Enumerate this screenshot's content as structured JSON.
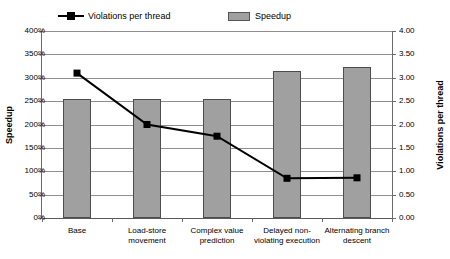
{
  "legend": {
    "entries": [
      {
        "label": "Violations per thread",
        "type": "line-marker",
        "color": "#000000"
      },
      {
        "label": "Speedup",
        "type": "bar-swatch",
        "color": "#a0a0a0"
      }
    ]
  },
  "axes": {
    "left_title": "Speedup",
    "right_title": "Violations per thread",
    "left_ticks": [
      "0%",
      "50%",
      "100%",
      "150%",
      "200%",
      "250%",
      "300%",
      "350%",
      "400%"
    ],
    "right_ticks": [
      "0.00",
      "0.50",
      "1.00",
      "1.50",
      "2.00",
      "2.50",
      "3.00",
      "3.50",
      "4.00"
    ]
  },
  "chart_data": {
    "type": "bar",
    "title": "",
    "xlabel": "",
    "ylabel": "Speedup",
    "y2label": "Violations per thread",
    "categories": [
      "Base",
      "Load-store movement",
      "Complex value prediction",
      "Delayed non-violating execution",
      "Alternating branch descent"
    ],
    "series": [
      {
        "name": "Speedup",
        "type": "bar",
        "axis": "left",
        "unit": "%",
        "color": "#a0a0a0",
        "values": [
          255,
          255,
          255,
          315,
          322
        ]
      },
      {
        "name": "Violations per thread",
        "type": "line",
        "axis": "right",
        "color": "#000000",
        "marker": "square",
        "values": [
          3.1,
          2.0,
          1.75,
          0.85,
          0.86
        ]
      }
    ],
    "ylim": [
      0,
      400
    ],
    "y2lim": [
      0,
      4.0
    ],
    "ytick_step": 50,
    "y2tick_step": 0.5,
    "grid": true,
    "legend_position": "top"
  }
}
